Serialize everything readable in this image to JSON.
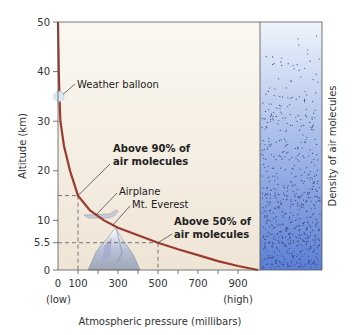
{
  "chart_data": {
    "type": "line",
    "title": "",
    "xlabel": "Atmospheric pressure (millibars)",
    "ylabel": "Altitude (km)",
    "xlim": [
      0,
      1000
    ],
    "ylim": [
      0,
      50
    ],
    "x_ticks": [
      0,
      100,
      300,
      500,
      700,
      900
    ],
    "y_ticks": [
      0,
      5.5,
      10,
      20,
      30,
      40,
      50
    ],
    "x_tick_labels": [
      "0",
      "100",
      "300",
      "500",
      "700",
      "900"
    ],
    "y_tick_labels": [
      "0",
      "5.5",
      "10",
      "20",
      "30",
      "40",
      "50"
    ],
    "x_low_label": "(low)",
    "x_high_label": "(high)",
    "series": [
      {
        "name": "Pressure vs altitude",
        "color": "#9b3a2e",
        "points": [
          [
            0,
            50
          ],
          [
            2,
            45
          ],
          [
            4,
            40
          ],
          [
            7,
            35
          ],
          [
            12,
            30
          ],
          [
            30,
            25
          ],
          [
            60,
            20
          ],
          [
            100,
            15
          ],
          [
            160,
            12
          ],
          [
            230,
            10
          ],
          [
            300,
            8.5
          ],
          [
            400,
            7
          ],
          [
            500,
            5.5
          ],
          [
            600,
            4.2
          ],
          [
            700,
            3
          ],
          [
            800,
            1.8
          ],
          [
            900,
            0.8
          ],
          [
            1000,
            0
          ]
        ]
      }
    ],
    "reference_lines": [
      {
        "x": 100,
        "y": 15
      },
      {
        "x": 500,
        "y": 5.5
      }
    ],
    "annotations": [
      {
        "text": "Weather balloon",
        "x": 0,
        "y": 35
      },
      {
        "text_lines": [
          "Above 90% of",
          "air molecules"
        ],
        "bold": true,
        "x": 100,
        "y": 15
      },
      {
        "text": "Airplane",
        "x": 160,
        "y": 11
      },
      {
        "text": "Mt. Everest",
        "x": 240,
        "y": 9
      },
      {
        "text_lines": [
          "Above 50% of",
          "air molecules"
        ],
        "bold": true,
        "x": 500,
        "y": 5.5
      }
    ],
    "density_panel_label": "Density of air molecules",
    "colors": {
      "plot_bg": "#f3ece1",
      "curve": "#9b3a2e",
      "density_top": "#eef4fb",
      "density_bottom": "#5b7fd6"
    }
  }
}
